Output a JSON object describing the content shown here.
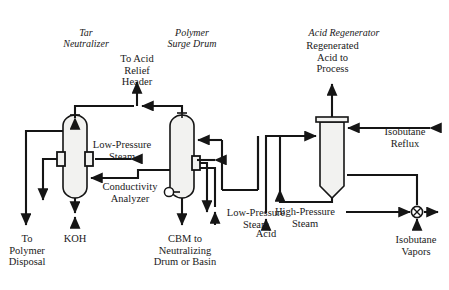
{
  "diagram": {
    "title_implicit": "",
    "type": "process-flow-diagram",
    "stroke_color": "#151515",
    "vessel_fill": "#f2f2f0",
    "background": "#ffffff"
  },
  "equipment": [
    {
      "id": "tar-neutralizer",
      "label": "Tar\nNeutralizer",
      "x": 86,
      "y": 27,
      "shape": "vertical-drum-rounded-both"
    },
    {
      "id": "polymer-surge-drum",
      "label": "Polymer\nSurge Drum",
      "x": 192,
      "y": 27,
      "shape": "vertical-drum-rounded-both"
    },
    {
      "id": "acid-regenerator",
      "label": "Acid Regenerator",
      "x": 343,
      "y": 27,
      "shape": "vertical-drum-flat-top-rounded-bottom"
    }
  ],
  "stream_labels": [
    {
      "id": "to-acid-relief-header",
      "label": "To Acid\nRelief\nHeader",
      "x": 137,
      "y": 54
    },
    {
      "id": "regenerated-acid-to-process",
      "label": "Regenerated\nAcid to\nProcess",
      "x": 299,
      "y": 40
    },
    {
      "id": "low-pressure-steam-left",
      "label": "Low-Pressure\nSteam",
      "x": 92,
      "y": 140
    },
    {
      "id": "conductivity-analyzer",
      "label": "Conductivity\nAnalyzer",
      "x": 98,
      "y": 181
    },
    {
      "id": "isobutane-reflux",
      "label": "Isobutane\nReflux",
      "x": 382,
      "y": 126
    },
    {
      "id": "high-pressure-steam",
      "label": "High-Pressure\nSteam",
      "x": 303,
      "y": 206
    },
    {
      "id": "low-pressure-steam-right",
      "label": "Low-Pressure\nSteam",
      "x": 212,
      "y": 207
    },
    {
      "id": "acid",
      "label": "Acid",
      "x": 266,
      "y": 220
    },
    {
      "id": "isobutane-vapors",
      "label": "Isobutane\nVapors",
      "x": 381,
      "y": 233
    },
    {
      "id": "to-polymer-disposal",
      "label": "To\nPolymer\nDisposal",
      "x": 9,
      "y": 233
    },
    {
      "id": "koh",
      "label": "KOH",
      "x": 58,
      "y": 233
    },
    {
      "id": "cbm-to-neutralizing-drum-or-basin",
      "label": "CBM to\nNeutralizing\nDrum or Basin",
      "x": 137,
      "y": 233
    }
  ]
}
